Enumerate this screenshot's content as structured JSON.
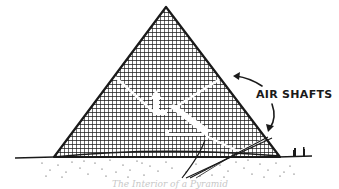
{
  "diagram": {
    "labels": {
      "air_shafts": "AIR SHAFTS"
    },
    "caption": "The Interior of a Pyramid",
    "colors": {
      "ink": "#1a1a1a",
      "background": "#ffffff",
      "caption": "#c8c8c8"
    },
    "elements": [
      "pyramid-body",
      "upper-air-shafts",
      "lower-air-shafts",
      "grand-gallery",
      "kings-chamber",
      "queens-chamber",
      "descending-passage",
      "ground-line",
      "sand",
      "people-figures",
      "annotation-arrows"
    ]
  }
}
